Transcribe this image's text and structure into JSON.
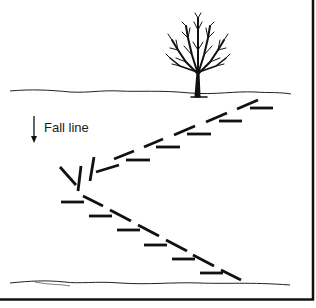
{
  "diagram": {
    "type": "switchback-trail-illustration",
    "labels": {
      "fall_line": "Fall line"
    },
    "elements": {
      "tree": "bare deciduous tree on upper slope",
      "upper_ground_line": "top edge of slope",
      "lower_ground_line": "bottom edge of slope",
      "upper_trail_leg": "dashed diagonal trail with horizontal step marks rising to the right",
      "lower_trail_leg": "dashed diagonal trail with horizontal step marks descending to the right",
      "switchback_turn": "turn at left with angled markers",
      "fall_line_arrow": "downward arrow"
    },
    "colors": {
      "ink": "#111111",
      "background": "#ffffff"
    }
  }
}
